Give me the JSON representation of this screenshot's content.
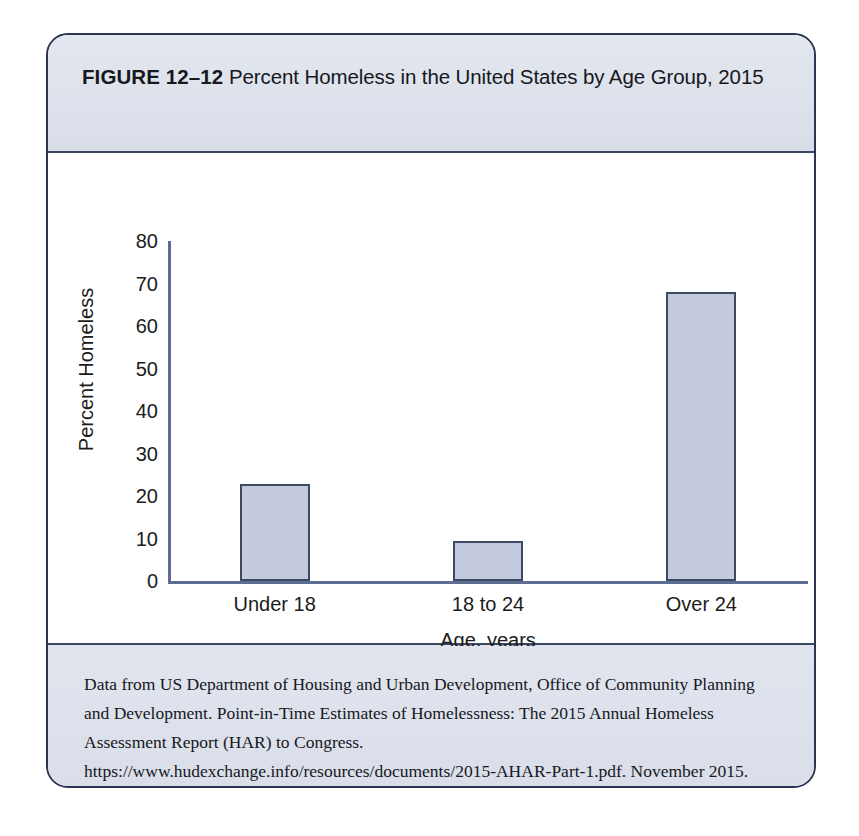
{
  "figure": {
    "number_label": "FIGURE 12–12",
    "title": "Percent Homeless in the United States by Age Group, 2015",
    "caption": "Data from US Department of Housing and Urban Development, Office of Community Planning and Development.  Point-in-Time Estimates of Homelessness: The 2015 Annual Homeless Assessment Report (HAR) to Congress. https://www.hudexchange.info/resources/documents/2015-AHAR-Part-1.pdf. November 2015."
  },
  "colors": {
    "card_border": "#2b3550",
    "band_fill": "#dfe3ec",
    "plot_fill": "#ffffff",
    "bar_fill": "#c3cade",
    "bar_border": "#3d4a66",
    "axis": "#5e6e92",
    "text": "#16181d"
  },
  "chart_data": {
    "type": "bar",
    "title": "Percent Homeless in the United States by Age Group, 2015",
    "categories": [
      "Under 18",
      "18 to 24",
      "Over 24"
    ],
    "values": [
      22.8,
      9.3,
      68
    ],
    "xlabel": "Age, years",
    "ylabel": "Percent Homeless",
    "ylim": [
      0,
      80
    ],
    "yticks": [
      0,
      10,
      20,
      30,
      40,
      50,
      60,
      70,
      80
    ],
    "ytick_labels": [
      "0",
      "10",
      "20",
      "30",
      "40",
      "50",
      "60",
      "70",
      "80"
    ],
    "grid": false,
    "legend": false
  }
}
